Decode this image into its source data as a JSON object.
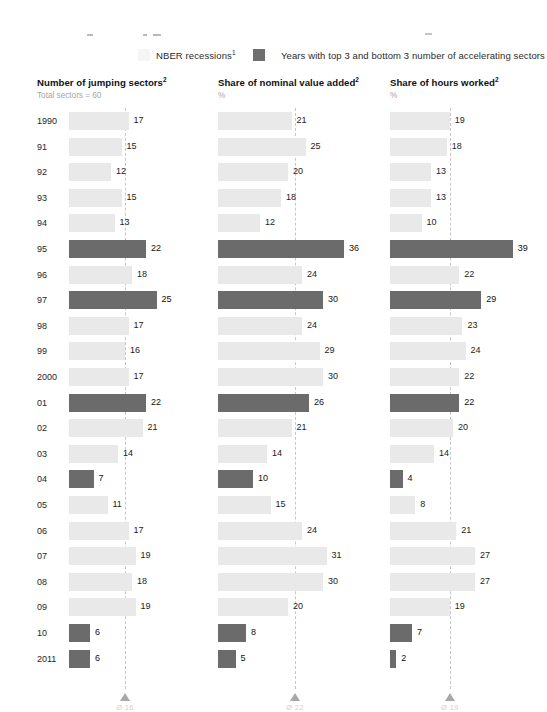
{
  "legend": {
    "recession": {
      "label": "NBER recessions",
      "footnote": "1",
      "swatch_color": "#ececec",
      "icon": "recession-band-swatch"
    },
    "top_bottom": {
      "label": "Years with top 3 and bottom 3 number of accelerating sectors",
      "footnote": "",
      "swatch_color": "#6b6b6b",
      "icon": "highlight-bar-swatch"
    }
  },
  "colors": {
    "bar_normal": "#e9e9e9",
    "bar_highlight": "#6b6b6b",
    "mean_line": "#c6c6c6",
    "marker": "#a8a8a8",
    "text": "#1c1c1c",
    "subtitle": "#a5a5a5"
  },
  "chart_data": {
    "type": "bar",
    "orientation": "horizontal",
    "title": "",
    "grid": false,
    "legend_position": "top",
    "categories": [
      "1990",
      "91",
      "92",
      "93",
      "94",
      "95",
      "96",
      "97",
      "98",
      "99",
      "2000",
      "01",
      "02",
      "03",
      "04",
      "05",
      "06",
      "07",
      "08",
      "09",
      "10",
      "2011"
    ],
    "xlabel": "",
    "ylabel": "",
    "panels": [
      {
        "title": "Number of jumping sectors",
        "title_footnote": "2",
        "subtitle": "Total sectors = 60",
        "ylabel": "",
        "xlim": [
          0,
          40
        ],
        "mean": 16,
        "mean_label": "Ø 16",
        "values": [
          17,
          15,
          12,
          15,
          13,
          22,
          18,
          25,
          17,
          16,
          17,
          22,
          21,
          14,
          7,
          11,
          17,
          19,
          18,
          19,
          6,
          6
        ],
        "highlight": [
          false,
          false,
          false,
          false,
          false,
          true,
          false,
          true,
          false,
          false,
          false,
          true,
          false,
          false,
          true,
          false,
          false,
          false,
          false,
          false,
          true,
          true
        ]
      },
      {
        "title": "Share of nominal value added",
        "title_footnote": "2",
        "subtitle": "%",
        "ylabel": "",
        "xlim": [
          0,
          40
        ],
        "mean": 22,
        "mean_label": "Ø 22",
        "values": [
          21,
          25,
          20,
          18,
          12,
          36,
          24,
          30,
          24,
          29,
          30,
          26,
          21,
          14,
          10,
          15,
          24,
          31,
          30,
          20,
          8,
          5
        ],
        "highlight": [
          false,
          false,
          false,
          false,
          false,
          true,
          false,
          true,
          false,
          false,
          false,
          true,
          false,
          false,
          true,
          false,
          false,
          false,
          false,
          false,
          true,
          true
        ]
      },
      {
        "title": "Share of hours worked",
        "title_footnote": "2",
        "subtitle": "%",
        "ylabel": "",
        "xlim": [
          0,
          40
        ],
        "mean": 19,
        "mean_label": "Ø 19",
        "values": [
          19,
          18,
          13,
          13,
          10,
          39,
          22,
          29,
          23,
          24,
          22,
          22,
          20,
          14,
          4,
          8,
          21,
          27,
          27,
          19,
          7,
          2
        ],
        "highlight": [
          false,
          false,
          false,
          false,
          false,
          true,
          false,
          true,
          false,
          false,
          false,
          true,
          false,
          false,
          true,
          false,
          false,
          false,
          false,
          false,
          true,
          true
        ]
      }
    ]
  }
}
